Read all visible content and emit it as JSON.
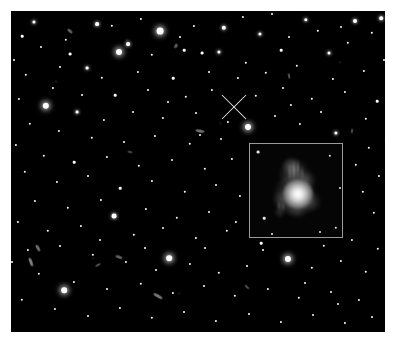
{
  "figure": {
    "kind": "astronomical-deep-field-image",
    "background_color": "#ffffff",
    "sky_color": "#000000",
    "caption": "",
    "frame": {
      "x": 11,
      "y": 11,
      "width": 374,
      "height": 321
    }
  },
  "marker": {
    "name": "target-crosshair",
    "shape": "x-cross",
    "center_x": 234,
    "center_y": 107,
    "arm_length": 17,
    "color": "#e6e6e6",
    "label": ""
  },
  "inset": {
    "name": "zoom-inset",
    "x": 249,
    "y": 143,
    "width": 94,
    "height": 95,
    "border_color": "#9a9a9a",
    "background_color": "#050505",
    "label": "",
    "object": {
      "name": "host-galaxy",
      "core_x": 48,
      "core_y": 50,
      "core_size": 30,
      "description": "bright compact nucleus with diffuse extended emission to the upper left"
    },
    "object_blobs": [
      {
        "x": 45,
        "y": 50,
        "w": 46,
        "h": 40,
        "ang": -12,
        "color": "rgba(150,150,150,0.55)"
      },
      {
        "x": 44,
        "y": 30,
        "w": 30,
        "h": 34,
        "ang": 8,
        "color": "rgba(120,120,120,0.55)"
      },
      {
        "x": 56,
        "y": 36,
        "w": 22,
        "h": 18,
        "ang": -20,
        "color": "rgba(130,130,130,0.5)"
      },
      {
        "x": 33,
        "y": 56,
        "w": 22,
        "h": 20,
        "ang": 15,
        "color": "rgba(110,110,110,0.5)"
      },
      {
        "x": 60,
        "y": 58,
        "w": 24,
        "h": 20,
        "ang": -5,
        "color": "rgba(125,125,125,0.5)"
      },
      {
        "x": 47,
        "y": 64,
        "w": 30,
        "h": 18,
        "ang": 6,
        "color": "rgba(115,115,115,0.45)"
      },
      {
        "x": 41,
        "y": 22,
        "w": 16,
        "h": 22,
        "ang": 0,
        "color": "rgba(145,145,145,0.45)"
      },
      {
        "x": 30,
        "y": 68,
        "w": 12,
        "h": 12,
        "ang": 0,
        "color": "rgba(105,105,105,0.45)"
      }
    ],
    "object_streaks": [
      {
        "x": 44,
        "y": 26,
        "w": 2,
        "h": 22,
        "ang": 0,
        "color": "rgba(200,200,200,0.55)"
      },
      {
        "x": 48,
        "y": 25,
        "w": 2,
        "h": 20,
        "ang": 0,
        "color": "rgba(190,190,190,0.5)"
      },
      {
        "x": 40,
        "y": 28,
        "w": 2,
        "h": 18,
        "ang": 0,
        "color": "rgba(180,180,180,0.45)"
      },
      {
        "x": 52,
        "y": 29,
        "w": 2,
        "h": 15,
        "ang": 0,
        "color": "rgba(175,175,175,0.4)"
      },
      {
        "x": 29,
        "y": 62,
        "w": 2,
        "h": 10,
        "ang": 0,
        "color": "rgba(170,170,170,0.45)"
      },
      {
        "x": 33,
        "y": 63,
        "w": 2,
        "h": 9,
        "ang": 0,
        "color": "rgba(160,160,160,0.4)"
      }
    ],
    "field_stars": [
      {
        "x": 8,
        "y": 8,
        "size": 1.4
      },
      {
        "x": 80,
        "y": 12,
        "size": 1.2
      },
      {
        "x": 14,
        "y": 74,
        "size": 1.3
      },
      {
        "x": 86,
        "y": 84,
        "size": 1.2
      },
      {
        "x": 70,
        "y": 88,
        "size": 1.0
      },
      {
        "x": 22,
        "y": 90,
        "size": 1.0
      },
      {
        "x": 90,
        "y": 44,
        "size": 1.0
      }
    ]
  },
  "stars": [
    {
      "x": 160,
      "y": 31,
      "r": 3.4,
      "b": "vbright"
    },
    {
      "x": 119,
      "y": 52,
      "r": 3.0,
      "b": "vbright"
    },
    {
      "x": 46,
      "y": 106,
      "r": 3.2,
      "b": "vbright"
    },
    {
      "x": 248,
      "y": 127,
      "r": 3.0,
      "b": "vbright"
    },
    {
      "x": 288,
      "y": 259,
      "r": 3.1,
      "b": "vbright"
    },
    {
      "x": 64,
      "y": 290,
      "r": 2.8,
      "b": "vbright"
    },
    {
      "x": 169,
      "y": 258,
      "r": 2.8,
      "b": "vbright"
    },
    {
      "x": 224,
      "y": 28,
      "r": 2.2,
      "b": "bright"
    },
    {
      "x": 97,
      "y": 24,
      "r": 1.9,
      "b": "bright"
    },
    {
      "x": 128,
      "y": 44,
      "r": 1.9,
      "b": "bright"
    },
    {
      "x": 355,
      "y": 21,
      "r": 2.0,
      "b": "bright"
    },
    {
      "x": 381,
      "y": 18,
      "r": 1.8,
      "b": "bright"
    },
    {
      "x": 306,
      "y": 20,
      "r": 1.7,
      "b": "bright"
    },
    {
      "x": 219,
      "y": 52,
      "r": 1.6,
      "b": "bright"
    },
    {
      "x": 260,
      "y": 34,
      "r": 1.6,
      "b": "bright"
    },
    {
      "x": 329,
      "y": 53,
      "r": 1.5,
      "b": "bright"
    },
    {
      "x": 202,
      "y": 53,
      "r": 1.4,
      "b": ""
    },
    {
      "x": 70,
      "y": 54,
      "r": 1.4,
      "b": ""
    },
    {
      "x": 184,
      "y": 50,
      "r": 1.3,
      "b": ""
    },
    {
      "x": 152,
      "y": 55,
      "r": 1.2,
      "b": ""
    },
    {
      "x": 281,
      "y": 50,
      "r": 1.3,
      "b": ""
    },
    {
      "x": 348,
      "y": 43,
      "r": 1.2,
      "b": ""
    },
    {
      "x": 34,
      "y": 22,
      "r": 1.6,
      "b": "bright"
    },
    {
      "x": 22,
      "y": 36,
      "r": 1.3,
      "b": ""
    },
    {
      "x": 66,
      "y": 40,
      "r": 1.2,
      "b": ""
    },
    {
      "x": 112,
      "y": 26,
      "r": 1.2,
      "b": ""
    },
    {
      "x": 141,
      "y": 19,
      "r": 1.1,
      "b": ""
    },
    {
      "x": 194,
      "y": 26,
      "r": 1.1,
      "b": ""
    },
    {
      "x": 243,
      "y": 17,
      "r": 1.1,
      "b": ""
    },
    {
      "x": 272,
      "y": 14,
      "r": 1.0,
      "b": ""
    },
    {
      "x": 318,
      "y": 31,
      "r": 1.2,
      "b": ""
    },
    {
      "x": 372,
      "y": 33,
      "r": 1.2,
      "b": ""
    },
    {
      "x": 87,
      "y": 68,
      "r": 1.4,
      "b": "bright"
    },
    {
      "x": 102,
      "y": 78,
      "r": 1.2,
      "b": ""
    },
    {
      "x": 138,
      "y": 72,
      "r": 1.1,
      "b": ""
    },
    {
      "x": 173,
      "y": 78,
      "r": 1.3,
      "b": ""
    },
    {
      "x": 209,
      "y": 72,
      "r": 1.0,
      "b": ""
    },
    {
      "x": 238,
      "y": 78,
      "r": 1.1,
      "b": ""
    },
    {
      "x": 266,
      "y": 73,
      "r": 1.2,
      "b": ""
    },
    {
      "x": 297,
      "y": 66,
      "r": 1.2,
      "b": ""
    },
    {
      "x": 333,
      "y": 79,
      "r": 1.1,
      "b": ""
    },
    {
      "x": 364,
      "y": 71,
      "r": 1.1,
      "b": ""
    },
    {
      "x": 26,
      "y": 75,
      "r": 1.2,
      "b": ""
    },
    {
      "x": 53,
      "y": 88,
      "r": 1.1,
      "b": ""
    },
    {
      "x": 115,
      "y": 95,
      "r": 1.3,
      "b": ""
    },
    {
      "x": 148,
      "y": 90,
      "r": 1.0,
      "b": ""
    },
    {
      "x": 186,
      "y": 97,
      "r": 1.2,
      "b": ""
    },
    {
      "x": 212,
      "y": 90,
      "r": 1.1,
      "b": ""
    },
    {
      "x": 256,
      "y": 96,
      "r": 1.2,
      "b": ""
    },
    {
      "x": 283,
      "y": 88,
      "r": 1.0,
      "b": ""
    },
    {
      "x": 312,
      "y": 99,
      "r": 1.2,
      "b": ""
    },
    {
      "x": 345,
      "y": 92,
      "r": 1.1,
      "b": ""
    },
    {
      "x": 377,
      "y": 101,
      "r": 1.3,
      "b": ""
    },
    {
      "x": 19,
      "y": 99,
      "r": 1.1,
      "b": ""
    },
    {
      "x": 77,
      "y": 112,
      "r": 1.4,
      "b": "bright"
    },
    {
      "x": 104,
      "y": 120,
      "r": 1.1,
      "b": ""
    },
    {
      "x": 133,
      "y": 112,
      "r": 1.0,
      "b": ""
    },
    {
      "x": 163,
      "y": 118,
      "r": 1.1,
      "b": ""
    },
    {
      "x": 196,
      "y": 113,
      "r": 1.0,
      "b": ""
    },
    {
      "x": 228,
      "y": 122,
      "r": 1.1,
      "b": ""
    },
    {
      "x": 275,
      "y": 116,
      "r": 1.0,
      "b": ""
    },
    {
      "x": 300,
      "y": 124,
      "r": 1.1,
      "b": ""
    },
    {
      "x": 336,
      "y": 133,
      "r": 1.6,
      "b": "bright"
    },
    {
      "x": 366,
      "y": 119,
      "r": 1.2,
      "b": ""
    },
    {
      "x": 30,
      "y": 124,
      "r": 1.2,
      "b": ""
    },
    {
      "x": 59,
      "y": 131,
      "r": 1.1,
      "b": ""
    },
    {
      "x": 92,
      "y": 138,
      "r": 1.2,
      "b": ""
    },
    {
      "x": 124,
      "y": 142,
      "r": 1.0,
      "b": ""
    },
    {
      "x": 155,
      "y": 136,
      "r": 1.1,
      "b": ""
    },
    {
      "x": 190,
      "y": 144,
      "r": 1.2,
      "b": ""
    },
    {
      "x": 221,
      "y": 139,
      "r": 1.0,
      "b": ""
    },
    {
      "x": 369,
      "y": 148,
      "r": 1.2,
      "b": ""
    },
    {
      "x": 16,
      "y": 145,
      "r": 1.1,
      "b": ""
    },
    {
      "x": 44,
      "y": 156,
      "r": 1.2,
      "b": ""
    },
    {
      "x": 74,
      "y": 162,
      "r": 1.3,
      "b": ""
    },
    {
      "x": 107,
      "y": 157,
      "r": 1.1,
      "b": ""
    },
    {
      "x": 139,
      "y": 166,
      "r": 1.2,
      "b": ""
    },
    {
      "x": 172,
      "y": 160,
      "r": 1.0,
      "b": ""
    },
    {
      "x": 205,
      "y": 169,
      "r": 1.2,
      "b": ""
    },
    {
      "x": 232,
      "y": 159,
      "r": 1.1,
      "b": ""
    },
    {
      "x": 356,
      "y": 165,
      "r": 1.2,
      "b": ""
    },
    {
      "x": 379,
      "y": 176,
      "r": 1.1,
      "b": ""
    },
    {
      "x": 25,
      "y": 172,
      "r": 1.2,
      "b": ""
    },
    {
      "x": 57,
      "y": 182,
      "r": 1.1,
      "b": ""
    },
    {
      "x": 88,
      "y": 176,
      "r": 1.0,
      "b": ""
    },
    {
      "x": 120,
      "y": 188,
      "r": 1.3,
      "b": ""
    },
    {
      "x": 152,
      "y": 181,
      "r": 1.1,
      "b": ""
    },
    {
      "x": 185,
      "y": 192,
      "r": 1.2,
      "b": ""
    },
    {
      "x": 216,
      "y": 185,
      "r": 1.0,
      "b": ""
    },
    {
      "x": 240,
      "y": 196,
      "r": 1.1,
      "b": ""
    },
    {
      "x": 363,
      "y": 192,
      "r": 1.2,
      "b": ""
    },
    {
      "x": 35,
      "y": 201,
      "r": 1.1,
      "b": ""
    },
    {
      "x": 68,
      "y": 208,
      "r": 1.2,
      "b": ""
    },
    {
      "x": 101,
      "y": 200,
      "r": 1.1,
      "b": ""
    },
    {
      "x": 114,
      "y": 216,
      "r": 2.4,
      "b": "bright"
    },
    {
      "x": 146,
      "y": 209,
      "r": 1.1,
      "b": ""
    },
    {
      "x": 177,
      "y": 218,
      "r": 1.2,
      "b": ""
    },
    {
      "x": 209,
      "y": 212,
      "r": 1.0,
      "b": ""
    },
    {
      "x": 236,
      "y": 222,
      "r": 1.1,
      "b": ""
    },
    {
      "x": 374,
      "y": 213,
      "r": 1.2,
      "b": ""
    },
    {
      "x": 18,
      "y": 222,
      "r": 1.1,
      "b": ""
    },
    {
      "x": 48,
      "y": 231,
      "r": 1.2,
      "b": ""
    },
    {
      "x": 81,
      "y": 226,
      "r": 1.1,
      "b": ""
    },
    {
      "x": 134,
      "y": 235,
      "r": 1.2,
      "b": ""
    },
    {
      "x": 163,
      "y": 228,
      "r": 1.0,
      "b": ""
    },
    {
      "x": 196,
      "y": 238,
      "r": 1.1,
      "b": ""
    },
    {
      "x": 227,
      "y": 231,
      "r": 1.2,
      "b": ""
    },
    {
      "x": 261,
      "y": 243,
      "r": 1.3,
      "b": ""
    },
    {
      "x": 292,
      "y": 236,
      "r": 1.1,
      "b": ""
    },
    {
      "x": 324,
      "y": 246,
      "r": 1.2,
      "b": ""
    },
    {
      "x": 352,
      "y": 240,
      "r": 1.1,
      "b": ""
    },
    {
      "x": 378,
      "y": 249,
      "r": 1.2,
      "b": ""
    },
    {
      "x": 28,
      "y": 250,
      "r": 1.1,
      "b": ""
    },
    {
      "x": 93,
      "y": 255,
      "r": 1.2,
      "b": ""
    },
    {
      "x": 126,
      "y": 262,
      "r": 1.1,
      "b": ""
    },
    {
      "x": 156,
      "y": 270,
      "r": 1.0,
      "b": ""
    },
    {
      "x": 190,
      "y": 264,
      "r": 1.1,
      "b": ""
    },
    {
      "x": 219,
      "y": 273,
      "r": 1.2,
      "b": ""
    },
    {
      "x": 247,
      "y": 266,
      "r": 1.0,
      "b": ""
    },
    {
      "x": 312,
      "y": 268,
      "r": 1.2,
      "b": ""
    },
    {
      "x": 341,
      "y": 261,
      "r": 1.1,
      "b": ""
    },
    {
      "x": 366,
      "y": 272,
      "r": 1.2,
      "b": ""
    },
    {
      "x": 39,
      "y": 274,
      "r": 1.2,
      "b": ""
    },
    {
      "x": 74,
      "y": 282,
      "r": 1.1,
      "b": ""
    },
    {
      "x": 107,
      "y": 289,
      "r": 1.0,
      "b": ""
    },
    {
      "x": 141,
      "y": 284,
      "r": 1.2,
      "b": ""
    },
    {
      "x": 173,
      "y": 293,
      "r": 1.1,
      "b": ""
    },
    {
      "x": 204,
      "y": 286,
      "r": 1.0,
      "b": ""
    },
    {
      "x": 235,
      "y": 296,
      "r": 1.2,
      "b": ""
    },
    {
      "x": 268,
      "y": 289,
      "r": 1.1,
      "b": ""
    },
    {
      "x": 299,
      "y": 298,
      "r": 1.2,
      "b": ""
    },
    {
      "x": 331,
      "y": 292,
      "r": 1.0,
      "b": ""
    },
    {
      "x": 359,
      "y": 300,
      "r": 1.1,
      "b": ""
    },
    {
      "x": 22,
      "y": 300,
      "r": 1.2,
      "b": ""
    },
    {
      "x": 55,
      "y": 309,
      "r": 1.1,
      "b": ""
    },
    {
      "x": 88,
      "y": 316,
      "r": 1.0,
      "b": ""
    },
    {
      "x": 120,
      "y": 308,
      "r": 1.1,
      "b": ""
    },
    {
      "x": 152,
      "y": 318,
      "r": 1.2,
      "b": ""
    },
    {
      "x": 184,
      "y": 312,
      "r": 1.0,
      "b": ""
    },
    {
      "x": 216,
      "y": 321,
      "r": 1.1,
      "b": ""
    },
    {
      "x": 249,
      "y": 314,
      "r": 1.0,
      "b": ""
    },
    {
      "x": 281,
      "y": 322,
      "r": 1.1,
      "b": ""
    },
    {
      "x": 313,
      "y": 315,
      "r": 1.0,
      "b": ""
    },
    {
      "x": 345,
      "y": 323,
      "r": 1.1,
      "b": ""
    },
    {
      "x": 372,
      "y": 317,
      "r": 1.0,
      "b": ""
    },
    {
      "x": 14,
      "y": 60,
      "r": 1.0,
      "b": ""
    },
    {
      "x": 10,
      "y": 190,
      "r": 1.0,
      "b": ""
    },
    {
      "x": 12,
      "y": 262,
      "r": 1.0,
      "b": ""
    },
    {
      "x": 384,
      "y": 60,
      "r": 1.0,
      "b": ""
    },
    {
      "x": 386,
      "y": 140,
      "r": 1.1,
      "b": ""
    },
    {
      "x": 246,
      "y": 63,
      "r": 1.2,
      "b": ""
    },
    {
      "x": 291,
      "y": 105,
      "r": 1.1,
      "b": ""
    },
    {
      "x": 321,
      "y": 112,
      "r": 1.0,
      "b": ""
    },
    {
      "x": 200,
      "y": 135,
      "r": 1.0,
      "b": ""
    },
    {
      "x": 168,
      "y": 102,
      "r": 1.0,
      "b": ""
    },
    {
      "x": 82,
      "y": 95,
      "r": 1.0,
      "b": ""
    },
    {
      "x": 60,
      "y": 67,
      "r": 1.0,
      "b": ""
    },
    {
      "x": 41,
      "y": 47,
      "r": 1.0,
      "b": ""
    },
    {
      "x": 180,
      "y": 37,
      "r": 1.0,
      "b": ""
    },
    {
      "x": 289,
      "y": 37,
      "r": 1.0,
      "b": ""
    },
    {
      "x": 341,
      "y": 27,
      "r": 1.0,
      "b": ""
    },
    {
      "x": 263,
      "y": 250,
      "r": 1.0,
      "b": ""
    },
    {
      "x": 305,
      "y": 283,
      "r": 1.0,
      "b": ""
    },
    {
      "x": 338,
      "y": 304,
      "r": 1.0,
      "b": ""
    },
    {
      "x": 205,
      "y": 248,
      "r": 1.0,
      "b": ""
    },
    {
      "x": 145,
      "y": 248,
      "r": 1.0,
      "b": ""
    },
    {
      "x": 100,
      "y": 240,
      "r": 1.0,
      "b": ""
    },
    {
      "x": 60,
      "y": 246,
      "r": 1.0,
      "b": ""
    }
  ],
  "smudges": [
    {
      "x": 31,
      "y": 262,
      "w": 9,
      "h": 3,
      "ang": 70,
      "o": 0.8
    },
    {
      "x": 38,
      "y": 248,
      "w": 7,
      "h": 3,
      "ang": 60,
      "o": 0.7
    },
    {
      "x": 158,
      "y": 296,
      "w": 10,
      "h": 3,
      "ang": 30,
      "o": 0.75
    },
    {
      "x": 200,
      "y": 131,
      "w": 9,
      "h": 3,
      "ang": 10,
      "o": 0.7
    },
    {
      "x": 70,
      "y": 31,
      "w": 6,
      "h": 3,
      "ang": 40,
      "o": 0.6
    },
    {
      "x": 176,
      "y": 46,
      "w": 5,
      "h": 3,
      "ang": 120,
      "o": 0.6
    },
    {
      "x": 289,
      "y": 76,
      "w": 6,
      "h": 2,
      "ang": 80,
      "o": 0.55
    },
    {
      "x": 119,
      "y": 257,
      "w": 7,
      "h": 3,
      "ang": 20,
      "o": 0.6
    },
    {
      "x": 98,
      "y": 265,
      "w": 6,
      "h": 2,
      "ang": 150,
      "o": 0.55
    },
    {
      "x": 247,
      "y": 287,
      "w": 6,
      "h": 2,
      "ang": 45,
      "o": 0.55
    },
    {
      "x": 352,
      "y": 131,
      "w": 5,
      "h": 2,
      "ang": 100,
      "o": 0.5
    },
    {
      "x": 130,
      "y": 152,
      "w": 5,
      "h": 2,
      "ang": 15,
      "o": 0.5
    }
  ]
}
